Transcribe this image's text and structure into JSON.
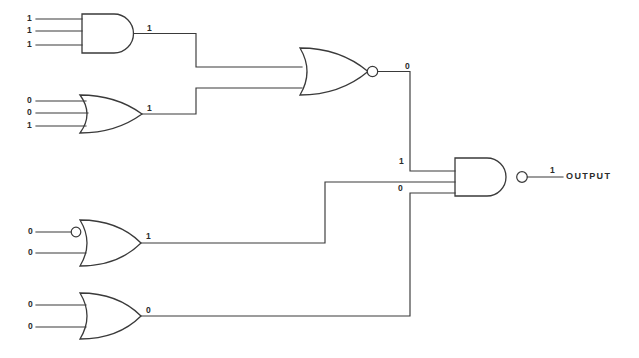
{
  "diagram": {
    "output_label": "OUTPUT"
  },
  "gates": [
    {
      "id": "gate-and-1",
      "type": "AND",
      "inputs": [
        "1",
        "1",
        "1"
      ],
      "output": "1"
    },
    {
      "id": "gate-or-2",
      "type": "OR",
      "inputs": [
        "0",
        "0",
        "1"
      ],
      "output": "1"
    },
    {
      "id": "gate-nor-3",
      "type": "NOR",
      "inputs": [
        "1",
        "1"
      ],
      "output": "0"
    },
    {
      "id": "gate-or-inverted-4",
      "type": "OR with inverted input",
      "inputs": [
        "0",
        "0"
      ],
      "output": "1"
    },
    {
      "id": "gate-or-5",
      "type": "OR",
      "inputs": [
        "0",
        "0"
      ],
      "output": "0"
    },
    {
      "id": "gate-nand-6",
      "type": "NAND",
      "inputs": [
        "0",
        "1",
        "0"
      ],
      "output": "1"
    }
  ],
  "labels": {
    "and1_in_a": "1",
    "and1_in_b": "1",
    "and1_in_c": "1",
    "and1_out": "1",
    "or2_in_a": "0",
    "or2_in_b": "0",
    "or2_in_c": "1",
    "or2_out": "1",
    "nor3_out": "0",
    "orinv4_in_a": "0",
    "orinv4_in_b": "0",
    "orinv4_out": "1",
    "or5_in_a": "0",
    "or5_in_b": "0",
    "or5_out": "0",
    "nand6_in_top": "1",
    "nand6_in_bottom": "0",
    "nand6_out": "1"
  }
}
